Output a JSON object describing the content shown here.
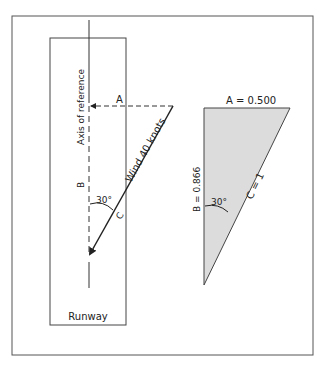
{
  "left_diagram": {
    "runway_label": "Runway",
    "axis_label": "Axis of reference",
    "point_a": "A",
    "point_b": "B",
    "point_c": "C",
    "wind_label": "Wind 40 knots",
    "angle_label": "30°"
  },
  "right_triangle": {
    "a_label": "A = 0.500",
    "b_label": "B = 0.866",
    "c_label": "C = 1",
    "angle_label": "30°",
    "fill_color": "#dcdcdc"
  },
  "colors": {
    "line": "#333333",
    "frame": "#555555"
  }
}
